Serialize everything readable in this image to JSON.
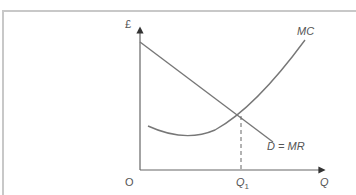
{
  "diagram": {
    "y_axis_label": "£",
    "x_axis_label": "Q",
    "origin_label": "O",
    "q1_label": "Q",
    "q1_subscript": "1",
    "curves": {
      "mc_label": "MC",
      "demand_label": "D = MR"
    },
    "colors": {
      "axis": "#555555",
      "curve": "#777777",
      "frame": "#c8c8c8"
    }
  }
}
